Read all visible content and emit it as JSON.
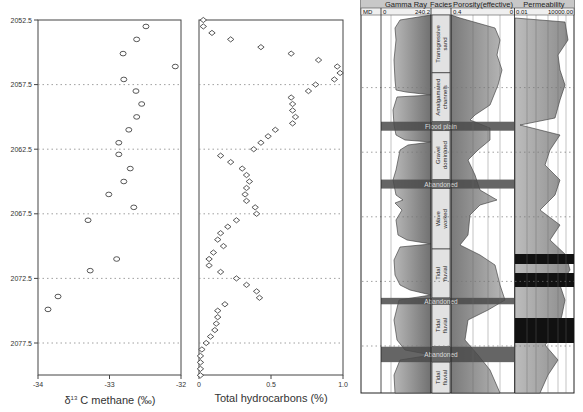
{
  "chart_data": [
    {
      "type": "scatter",
      "title": "",
      "xlabel": "δ13 C methane (‰)",
      "xlabel_prefix": "δ",
      "xlabel_sup": "13",
      "xlabel_rest": " C methane (‰)",
      "ylabel": "Depth",
      "xlim": [
        -34,
        -32
      ],
      "ylim": [
        2052.5,
        2080.0
      ],
      "y_inverted": true,
      "xticks": [
        "-34",
        "-33",
        "-32"
      ],
      "yticks": [
        "2052.5",
        "2057.5",
        "2062.5",
        "2067.5",
        "2072.5",
        "2077.5"
      ],
      "grid": "horizontal dotted at y ticks",
      "marker": "circle",
      "points": [
        {
          "x": -32.49,
          "y": 2053.0
        },
        {
          "x": -32.62,
          "y": 2054.0
        },
        {
          "x": -32.81,
          "y": 2055.1
        },
        {
          "x": -32.08,
          "y": 2056.1
        },
        {
          "x": -32.8,
          "y": 2057.1
        },
        {
          "x": -32.63,
          "y": 2058.0
        },
        {
          "x": -32.55,
          "y": 2059.0
        },
        {
          "x": -32.62,
          "y": 2060.0
        },
        {
          "x": -32.73,
          "y": 2061.0
        },
        {
          "x": -32.87,
          "y": 2062.0
        },
        {
          "x": -32.87,
          "y": 2062.9
        },
        {
          "x": -32.71,
          "y": 2064.0
        },
        {
          "x": -32.8,
          "y": 2065.0
        },
        {
          "x": -33.01,
          "y": 2066.0
        },
        {
          "x": -32.66,
          "y": 2067.0
        },
        {
          "x": -33.3,
          "y": 2068.0
        },
        {
          "x": -32.9,
          "y": 2071.0
        },
        {
          "x": -33.27,
          "y": 2071.9
        },
        {
          "x": -33.72,
          "y": 2073.9
        },
        {
          "x": -33.86,
          "y": 2074.9
        }
      ]
    },
    {
      "type": "scatter",
      "title": "",
      "xlabel": "Total hydrocarbons (%)",
      "ylabel": "Depth",
      "xlim": [
        0,
        1.0
      ],
      "ylim": [
        2052.5,
        2080.0
      ],
      "y_inverted": true,
      "xticks": [
        "0",
        "0.5",
        "1.0"
      ],
      "grid": "horizontal dotted at y ticks",
      "marker": "diamond",
      "points": [
        {
          "x": 0.03,
          "y": 2052.5
        },
        {
          "x": 0.03,
          "y": 2053.0
        },
        {
          "x": 0.09,
          "y": 2053.5
        },
        {
          "x": 0.22,
          "y": 2054.0
        },
        {
          "x": 0.43,
          "y": 2054.6
        },
        {
          "x": 0.64,
          "y": 2055.1
        },
        {
          "x": 0.83,
          "y": 2055.6
        },
        {
          "x": 0.96,
          "y": 2056.1
        },
        {
          "x": 0.98,
          "y": 2056.6
        },
        {
          "x": 0.94,
          "y": 2057.1
        },
        {
          "x": 0.81,
          "y": 2057.5
        },
        {
          "x": 0.76,
          "y": 2058.0
        },
        {
          "x": 0.64,
          "y": 2058.5
        },
        {
          "x": 0.65,
          "y": 2059.0
        },
        {
          "x": 0.65,
          "y": 2059.5
        },
        {
          "x": 0.67,
          "y": 2060.0
        },
        {
          "x": 0.65,
          "y": 2060.5
        },
        {
          "x": 0.53,
          "y": 2061.0
        },
        {
          "x": 0.48,
          "y": 2061.5
        },
        {
          "x": 0.43,
          "y": 2062.0
        },
        {
          "x": 0.38,
          "y": 2062.5
        },
        {
          "x": 0.15,
          "y": 2063.0
        },
        {
          "x": 0.22,
          "y": 2063.5
        },
        {
          "x": 0.3,
          "y": 2064.0
        },
        {
          "x": 0.33,
          "y": 2064.5
        },
        {
          "x": 0.35,
          "y": 2065.0
        },
        {
          "x": 0.33,
          "y": 2065.5
        },
        {
          "x": 0.32,
          "y": 2066.0
        },
        {
          "x": 0.33,
          "y": 2066.5
        },
        {
          "x": 0.39,
          "y": 2067.0
        },
        {
          "x": 0.4,
          "y": 2067.5
        },
        {
          "x": 0.26,
          "y": 2068.0
        },
        {
          "x": 0.2,
          "y": 2068.5
        },
        {
          "x": 0.15,
          "y": 2069.0
        },
        {
          "x": 0.13,
          "y": 2069.5
        },
        {
          "x": 0.17,
          "y": 2070.0
        },
        {
          "x": 0.1,
          "y": 2070.5
        },
        {
          "x": 0.07,
          "y": 2071.0
        },
        {
          "x": 0.07,
          "y": 2071.5
        },
        {
          "x": 0.15,
          "y": 2072.0
        },
        {
          "x": 0.26,
          "y": 2072.5
        },
        {
          "x": 0.33,
          "y": 2073.0
        },
        {
          "x": 0.4,
          "y": 2073.5
        },
        {
          "x": 0.42,
          "y": 2074.0
        },
        {
          "x": 0.18,
          "y": 2074.5
        },
        {
          "x": 0.13,
          "y": 2075.0
        },
        {
          "x": 0.13,
          "y": 2075.5
        },
        {
          "x": 0.12,
          "y": 2076.0
        },
        {
          "x": 0.11,
          "y": 2076.5
        },
        {
          "x": 0.08,
          "y": 2077.0
        },
        {
          "x": 0.05,
          "y": 2077.5
        },
        {
          "x": 0.02,
          "y": 2078.0
        },
        {
          "x": 0.01,
          "y": 2078.5
        },
        {
          "x": 0.01,
          "y": 2079.0
        },
        {
          "x": 0.01,
          "y": 2079.5
        },
        {
          "x": 0.01,
          "y": 2080.0
        }
      ]
    },
    {
      "type": "table",
      "title": "Well log",
      "tracks": {
        "header": [
          "Gamma Ray",
          "Facies",
          "Porosity(effective)",
          "Permeability"
        ],
        "subheader": {
          "md": "MD",
          "gr_min": "0",
          "gr_max": "240.2",
          "por_min": "0.4",
          "por_max": "0",
          "perm_min": "0.01",
          "perm_max": "10000.00"
        }
      },
      "facies": [
        {
          "label": "Transgressive sand",
          "top": 2052.5,
          "base": 2057.0,
          "dark": false
        },
        {
          "label": "Amalgamated channels",
          "top": 2057.0,
          "base": 2060.8,
          "dark": false
        },
        {
          "label": "Flood plain",
          "top": 2060.8,
          "base": 2061.5,
          "dark": true
        },
        {
          "label": "Gravel dominated",
          "top": 2061.5,
          "base": 2065.3,
          "dark": false
        },
        {
          "label": "Abandoned",
          "top": 2065.3,
          "base": 2066.0,
          "dark": true
        },
        {
          "label": "Wave worked",
          "top": 2066.0,
          "base": 2070.7,
          "dark": false
        },
        {
          "label": "Tidal fluvial",
          "top": 2070.7,
          "base": 2074.5,
          "dark": false
        },
        {
          "label": "Abandoned",
          "top": 2074.5,
          "base": 2075.0,
          "dark": true
        },
        {
          "label": "Tidal fluvial",
          "top": 2075.0,
          "base": 2078.3,
          "dark": false
        },
        {
          "label": "Abandoned",
          "top": 2078.3,
          "base": 2079.5,
          "dark": true
        },
        {
          "label": "Tidal fluvial",
          "top": 2079.5,
          "base": 2081.9,
          "dark": false
        }
      ]
    }
  ],
  "colors": {
    "axis": "#333333",
    "marker": "#444444",
    "grid": "#888888",
    "log_fill": "#9a9a9a",
    "log_dark": "#555555",
    "facies_bg": "#dcdcdc",
    "header_bg": "#c8c8c8"
  }
}
